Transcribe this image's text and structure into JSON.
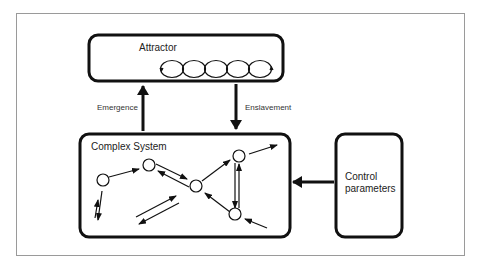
{
  "diagram": {
    "attractor": {
      "label": "Attractor"
    },
    "complex_system": {
      "label": "Complex System"
    },
    "control": {
      "line1": "Control",
      "line2": "parameters"
    },
    "arrows": {
      "emergence": "Emergence",
      "enslavement": "Enslavement"
    },
    "colors": {
      "stroke": "#111111",
      "frame": "#9a9a9a",
      "background": "#ffffff"
    }
  }
}
